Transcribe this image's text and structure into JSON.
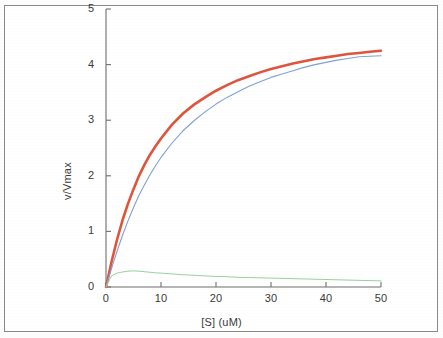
{
  "figure": {
    "background_color": "#ffffff",
    "frame_color": "#8a8a8a"
  },
  "chart_data": {
    "type": "line",
    "title": "",
    "xlabel": "[S] (uM)",
    "ylabel": "v/Vmax",
    "xlim": [
      0,
      50
    ],
    "ylim": [
      0,
      5
    ],
    "xticks": [
      0,
      10,
      20,
      30,
      40,
      50
    ],
    "yticks": [
      0,
      1,
      2,
      3,
      4,
      5
    ],
    "xtick_labels": [
      "0",
      "10",
      "20",
      "30",
      "40",
      "50"
    ],
    "ytick_labels": [
      "0",
      "1",
      "2",
      "3",
      "4",
      "5"
    ],
    "grid": false,
    "legend": "none",
    "x": [
      0,
      1,
      2,
      3,
      4,
      5,
      6,
      7,
      8,
      9,
      10,
      12,
      14,
      16,
      18,
      20,
      22,
      24,
      26,
      28,
      30,
      32,
      34,
      36,
      38,
      40,
      42,
      44,
      46,
      48,
      50
    ],
    "series": [
      {
        "name": "red-curve",
        "color": "#e0543c",
        "width": 2.6,
        "values": [
          0.0,
          0.45,
          0.85,
          1.2,
          1.5,
          1.76,
          2.0,
          2.2,
          2.38,
          2.53,
          2.67,
          2.92,
          3.12,
          3.28,
          3.41,
          3.53,
          3.63,
          3.72,
          3.79,
          3.86,
          3.92,
          3.97,
          4.02,
          4.06,
          4.1,
          4.13,
          4.16,
          4.19,
          4.21,
          4.23,
          4.25
        ]
      },
      {
        "name": "blue-curve",
        "color": "#7fa2d4",
        "width": 1.1,
        "values": [
          0.0,
          0.33,
          0.64,
          0.93,
          1.19,
          1.43,
          1.65,
          1.84,
          2.02,
          2.18,
          2.33,
          2.59,
          2.81,
          2.99,
          3.15,
          3.29,
          3.41,
          3.51,
          3.61,
          3.69,
          3.77,
          3.83,
          3.89,
          3.95,
          4.0,
          4.04,
          4.08,
          4.11,
          4.14,
          4.15,
          4.16
        ]
      },
      {
        "name": "green-curve",
        "color": "#9bd19b",
        "width": 1.0,
        "values": [
          0.0,
          0.2,
          0.25,
          0.27,
          0.285,
          0.29,
          0.285,
          0.275,
          0.265,
          0.255,
          0.25,
          0.235,
          0.22,
          0.21,
          0.2,
          0.19,
          0.185,
          0.175,
          0.17,
          0.165,
          0.16,
          0.155,
          0.15,
          0.145,
          0.14,
          0.135,
          0.13,
          0.125,
          0.12,
          0.115,
          0.11
        ]
      }
    ],
    "axis_color": "#6f6f6f"
  }
}
